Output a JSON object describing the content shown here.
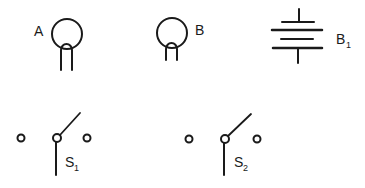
{
  "diagram": {
    "components": [
      {
        "id": "bulb-a",
        "type": "lamp",
        "label": "A"
      },
      {
        "id": "bulb-b",
        "type": "lamp",
        "label": "B"
      },
      {
        "id": "battery-b1",
        "type": "battery",
        "label": "B",
        "subscript": "1"
      },
      {
        "id": "switch-s1",
        "type": "two-way-switch",
        "label": "S",
        "subscript": "1"
      },
      {
        "id": "switch-s2",
        "type": "two-way-switch",
        "label": "S",
        "subscript": "2"
      }
    ],
    "colors": {
      "ink": "#1a1a1a",
      "background": "#ffffff"
    }
  }
}
